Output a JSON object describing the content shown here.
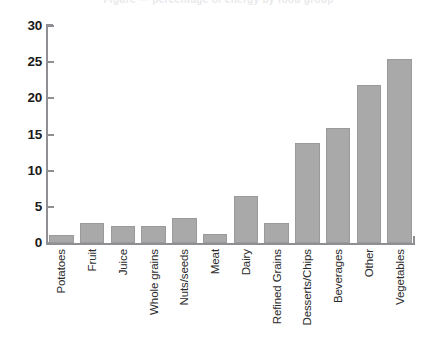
{
  "caption": {
    "clipped_text": "Figure — percentage of energy by food group"
  },
  "chart_data": {
    "type": "bar",
    "title": "",
    "subtitle": "",
    "xlabel": "",
    "ylabel": "",
    "ylim": [
      0,
      30
    ],
    "yticks": [
      0,
      5,
      10,
      15,
      20,
      25,
      30
    ],
    "ytick_labels": [
      "0",
      "5",
      "10",
      "15",
      "20",
      "25",
      "30"
    ],
    "grid": false,
    "legend": null,
    "bar_color": "#a9a9a9",
    "bar_edge_color": "#9a9a9a",
    "axis_color": "#8e8e93",
    "categories": [
      "Potatoes",
      "Fruit",
      "Juice",
      "Whole grains",
      "Nuts/seeds",
      "Meat",
      "Dairy",
      "Refined Grains",
      "Desserts/Chips",
      "Beverages",
      "Other",
      "Vegetables"
    ],
    "values": [
      1.1,
      2.8,
      2.4,
      2.4,
      3.5,
      1.3,
      6.5,
      2.7,
      13.8,
      15.9,
      21.9,
      25.4
    ]
  }
}
